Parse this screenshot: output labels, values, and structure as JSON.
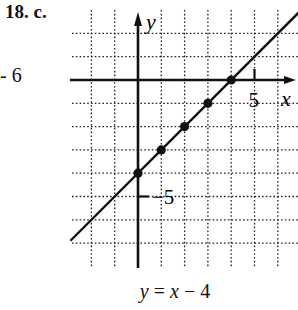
{
  "problem_label": "18. c.",
  "left_fragment": "- 6",
  "chart_data": {
    "type": "line",
    "title": "",
    "xlabel": "x",
    "ylabel": "y",
    "xlim": [
      -2,
      6
    ],
    "ylim": [
      -8,
      3
    ],
    "grid": true,
    "tick_labels": {
      "x": [
        "5"
      ],
      "y": [
        "-5"
      ]
    },
    "x_ticks": [
      5
    ],
    "y_ticks": [
      -5
    ],
    "series": [
      {
        "name": "y = x - 4",
        "slope": 1,
        "intercept": -4,
        "x_range": [
          -2.9,
          6.9
        ]
      }
    ],
    "points": [
      {
        "x": 0,
        "y": -4
      },
      {
        "x": 1,
        "y": -3
      },
      {
        "x": 2,
        "y": -2
      },
      {
        "x": 3,
        "y": -1
      },
      {
        "x": 4,
        "y": 0
      }
    ],
    "caption": {
      "y": "y",
      "eq": "=",
      "x": "x",
      "op": "−",
      "c": "4"
    }
  }
}
